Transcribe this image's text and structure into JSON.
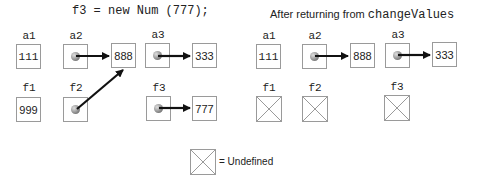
{
  "left_panel": {
    "title": "f3 = new Num (777);",
    "vars": {
      "a1": {
        "label": "a1",
        "value": "111"
      },
      "a2": {
        "label": "a2",
        "target": "888"
      },
      "a3": {
        "label": "a3",
        "target": "333"
      },
      "f1": {
        "label": "f1",
        "value": "999"
      },
      "f2": {
        "label": "f2",
        "target": "888"
      },
      "f3": {
        "label": "f3",
        "target": "777"
      }
    },
    "objects": {
      "o888": "888",
      "o333": "333",
      "o777": "777"
    }
  },
  "right_panel": {
    "title_prefix": "After returning from ",
    "title_code": "changeValues",
    "vars": {
      "a1": {
        "label": "a1",
        "value": "111"
      },
      "a2": {
        "label": "a2",
        "target": "888"
      },
      "a3": {
        "label": "a3",
        "target": "333"
      },
      "f1": {
        "label": "f1",
        "state": "undefined"
      },
      "f2": {
        "label": "f2",
        "state": "undefined"
      },
      "f3": {
        "label": "f3",
        "state": "undefined"
      }
    },
    "objects": {
      "o888": "888",
      "o333": "333"
    }
  },
  "legend": {
    "text": "= Undefined",
    "icon": "crossed-box-icon"
  }
}
